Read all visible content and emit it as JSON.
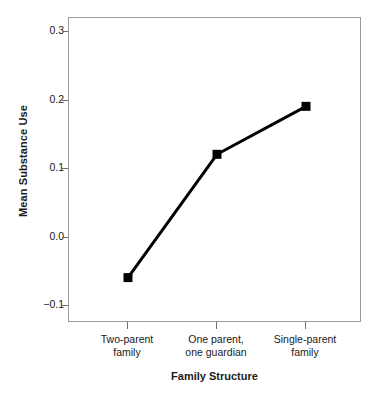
{
  "chart_data": {
    "type": "line",
    "title": "",
    "xlabel": "Family Structure",
    "ylabel": "Mean Substance Use",
    "categories": [
      "Two-parent family",
      "One parent, one guardian",
      "Single-parent family"
    ],
    "category_lines": [
      [
        "Two-parent",
        "family"
      ],
      [
        "One parent,",
        "one guardian"
      ],
      [
        "Single-parent",
        "family"
      ]
    ],
    "values": [
      -0.06,
      0.12,
      0.19
    ],
    "ylim": [
      -0.13,
      0.33
    ],
    "yticks": [
      0.3,
      0.2,
      0.1,
      0.0,
      -0.1
    ],
    "ytick_labels": [
      "0.3",
      "0.2",
      "0.1",
      "0.0",
      "−0.1"
    ],
    "grid": false,
    "legend": "none",
    "marker": "square",
    "series_color": "#000000",
    "frame_color": "#9a9a9a",
    "line_width": 3,
    "marker_size": 9
  },
  "axis_titles": {
    "x": "Family Structure",
    "y": "Mean Substance Use"
  }
}
